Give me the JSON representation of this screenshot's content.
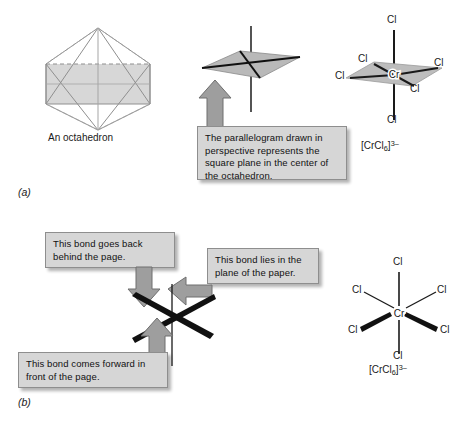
{
  "figure": {
    "panels": [
      {
        "letter": "(a)"
      },
      {
        "letter": "(b)"
      }
    ]
  },
  "panel_a": {
    "octahedron_caption": "An octahedron",
    "callout_parallelogram": "The parallelogram drawn in perspective represents the square plane in the center of the octahedron.",
    "complex": {
      "center_atom": "Cr",
      "ligand_labels": [
        "Cl",
        "Cl",
        "Cl",
        "Cl",
        "Cl",
        "Cl"
      ],
      "formula_prefix": "[CrCl",
      "formula_sub": "6",
      "formula_mid": "]",
      "formula_sup": "3–"
    }
  },
  "panel_b": {
    "callout_back": "This bond goes back behind the page.",
    "callout_plane": "This bond lies in the plane of the paper.",
    "callout_forward": "This bond comes forward in front of the page.",
    "complex": {
      "center_atom": "Cr",
      "ligand_labels": [
        "Cl",
        "Cl",
        "Cl",
        "Cl",
        "Cl",
        "Cl"
      ],
      "formula_prefix": "[CrCl",
      "formula_sub": "6",
      "formula_mid": "]",
      "formula_sup": "3–"
    }
  },
  "colors": {
    "plane_fill": "#b9b9b9",
    "bond": "#111111",
    "wire": "#9a9a9a",
    "arrow_fill": "#9e9e9e",
    "arrow_stroke": "#6e6e6e",
    "callout_bg": "#d6d6d6",
    "background": "#ffffff"
  }
}
